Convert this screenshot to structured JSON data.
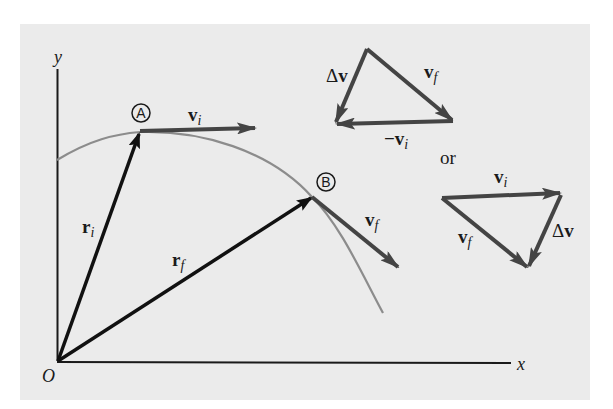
{
  "diagram": {
    "colors": {
      "background": "#ebebeb",
      "axes": "#1a1a1a",
      "position_vectors": "#111111",
      "velocity_vectors": "#444444",
      "path_curve": "#8c8c8c"
    },
    "axes": {
      "y_label": "y",
      "x_label": "x",
      "origin_label": "O"
    },
    "points": {
      "A": {
        "label": "A"
      },
      "B": {
        "label": "B"
      }
    },
    "vectors": {
      "r_i": {
        "main": "r",
        "sub": "i"
      },
      "r_f": {
        "main": "r",
        "sub": "f"
      },
      "v_i": {
        "main": "v",
        "sub": "i"
      },
      "v_f": {
        "main": "v",
        "sub": "f"
      }
    },
    "triangle_top": {
      "delta_v": {
        "delta": "Δ",
        "main": "v"
      },
      "v_f": {
        "main": "v",
        "sub": "f"
      },
      "neg_v_i": {
        "minus": "−",
        "main": "v",
        "sub": "i"
      }
    },
    "separator": "or",
    "triangle_bottom": {
      "v_i": {
        "main": "v",
        "sub": "i"
      },
      "v_f": {
        "main": "v",
        "sub": "f"
      },
      "delta_v": {
        "delta": "Δ",
        "main": "v"
      }
    }
  }
}
